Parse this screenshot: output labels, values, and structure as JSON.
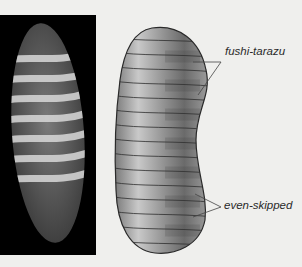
{
  "figure": {
    "photo_panel": {
      "description": "Fluorescence micrograph of embryo showing stripes",
      "stripe_count": 7
    },
    "diagram_panel": {
      "description": "Schematic embryo with alternating pair-rule stripes",
      "stripe_count": 14
    },
    "labels": {
      "top": "fushi-tarazu",
      "bottom": "even-skipped"
    },
    "colors": {
      "background": "#efefed",
      "photo_background": "#000000",
      "embryo_light": "#cfcfcf",
      "embryo_dark": "#5a5a5a",
      "outline": "#2a2a2a"
    }
  }
}
